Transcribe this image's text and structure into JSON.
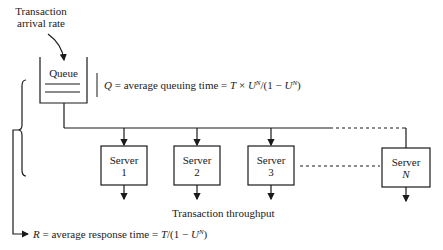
{
  "diagram": {
    "arrival_label_line1": "Transaction",
    "arrival_label_line2": "arrival rate",
    "queue_label": "Queue",
    "queue_formula": {
      "var": "Q",
      "text": " = average queuing time = ",
      "T": "T",
      "times": " × ",
      "U": "U",
      "N": "N",
      "rest": "/(1 − ",
      "U2": "U",
      "N2": "N",
      "close": ")"
    },
    "servers": [
      {
        "name": "Server",
        "index": "1"
      },
      {
        "name": "Server",
        "index": "2"
      },
      {
        "name": "Server",
        "index": "3"
      },
      {
        "name": "Server",
        "index": "N"
      }
    ],
    "throughput_label": "Transaction throughput",
    "response_formula": {
      "var": "R",
      "text": " = average response time = ",
      "T": "T",
      "rest": "/(1 − ",
      "U": "U",
      "N": "N",
      "close": ")"
    },
    "colors": {
      "line": "#1a1a1a",
      "background": "#ffffff"
    }
  }
}
